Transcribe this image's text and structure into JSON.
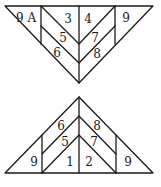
{
  "diagram": {
    "top_triangle": {
      "orientation": "inverted",
      "labels": [
        {
          "id": "9A",
          "text": "9 A",
          "x": 26,
          "y": 22
        },
        {
          "id": "3",
          "text": "3",
          "x": 68,
          "y": 23
        },
        {
          "id": "4",
          "text": "4",
          "x": 88,
          "y": 23
        },
        {
          "id": "9",
          "text": "9",
          "x": 126,
          "y": 22
        },
        {
          "id": "5",
          "text": "5",
          "x": 63,
          "y": 42
        },
        {
          "id": "7",
          "text": "7",
          "x": 95,
          "y": 42
        },
        {
          "id": "6",
          "text": "6",
          "x": 57,
          "y": 57
        },
        {
          "id": "8",
          "text": "8",
          "x": 97,
          "y": 58
        }
      ]
    },
    "bottom_triangle": {
      "orientation": "upright",
      "labels": [
        {
          "id": "6",
          "text": "6",
          "x": 61,
          "y": 130
        },
        {
          "id": "8",
          "text": "8",
          "x": 97,
          "y": 130
        },
        {
          "id": "5",
          "text": "5",
          "x": 65,
          "y": 146
        },
        {
          "id": "7",
          "text": "7",
          "x": 94,
          "y": 146
        },
        {
          "id": "9-left",
          "text": "9",
          "x": 34,
          "y": 166
        },
        {
          "id": "1",
          "text": "1",
          "x": 70,
          "y": 166
        },
        {
          "id": "2",
          "text": "2",
          "x": 89,
          "y": 166
        },
        {
          "id": "9-right",
          "text": "9",
          "x": 128,
          "y": 166
        }
      ]
    }
  }
}
